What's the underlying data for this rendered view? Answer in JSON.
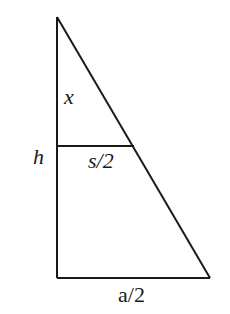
{
  "diagram": {
    "stroke_color": "#1a1a1a",
    "labels": {
      "top_segment": "x",
      "height": "h",
      "inner_half_width": "s/2",
      "base_half_width": "a/2"
    }
  }
}
